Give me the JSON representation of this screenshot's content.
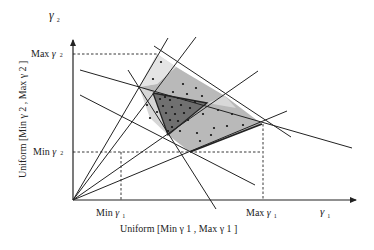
{
  "diagram": {
    "axes": {
      "y_axis_symbol": "γ",
      "y_axis_subscript": "2",
      "x_axis_symbol": "γ",
      "x_axis_subscript": "1",
      "y_axis_distribution_label": "Uniform [Min γ 2 , Max γ 2 ]",
      "x_axis_distribution_label": "Uniform [Min γ 1 , Max γ 1 ]"
    },
    "ticks": {
      "max_y": {
        "prefix": "Max ",
        "symbol": "γ",
        "sub": "2"
      },
      "min_y": {
        "prefix": "Min ",
        "symbol": "γ",
        "sub": "2"
      },
      "min_x": {
        "prefix": "Min ",
        "symbol": "γ",
        "sub": "1"
      },
      "max_x": {
        "prefix": "Max ",
        "symbol": "γ",
        "sub": "1"
      }
    },
    "regions": [
      {
        "name": "outer-feasible-region",
        "shade": "light",
        "color": "#dcdcdc"
      },
      {
        "name": "intermediate-region",
        "shade": "medium",
        "color": "#b4b4b4"
      },
      {
        "name": "inner-region",
        "shade": "dark",
        "color": "#6e6e6e"
      }
    ],
    "line_color": "#222222"
  }
}
